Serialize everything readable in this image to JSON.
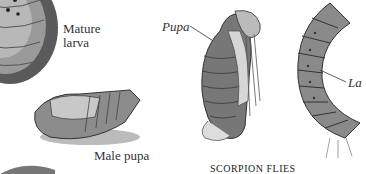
{
  "labels": {
    "mature_larva_line1": "Mature",
    "mature_larva_line2": "larva",
    "male_pupa": "Male pupa",
    "pupa": "Pupa",
    "larva_partial": "La"
  },
  "caption": "SCORPION FLIES"
}
